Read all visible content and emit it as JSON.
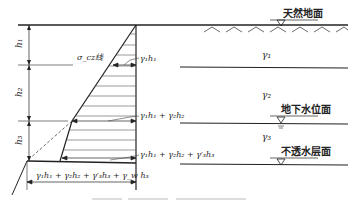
{
  "figure": {
    "surface_labels": {
      "ground": "天然地面",
      "water_table": "地下水位面",
      "impermeable": "不透水层面"
    },
    "layers": [
      {
        "unit_weight": "γ₁",
        "thickness": "h₁"
      },
      {
        "unit_weight": "γ₂",
        "thickness": "h₂"
      },
      {
        "unit_weight": "γ₃",
        "thickness": "h₃"
      }
    ],
    "stress_curve_label": "σ_cz线",
    "stress_values": [
      "γ₁h₁",
      "γ₁h₁ + γ₂h₂",
      "γ₁h₁ + γ₂h₂ + γ′₃h₃",
      "γ₁h₁ + γ₂h₂ + γ′₃h₃ + γ_w h₃"
    ],
    "colors": {
      "line": "#222222",
      "background": "#ffffff"
    }
  }
}
